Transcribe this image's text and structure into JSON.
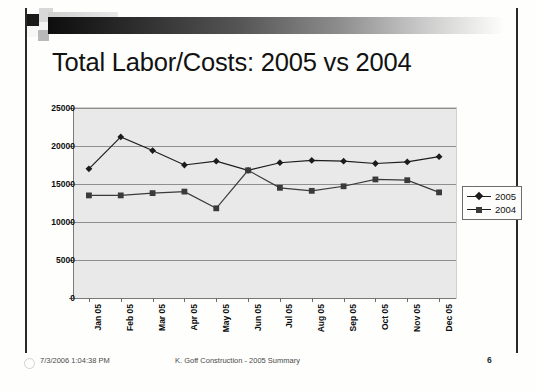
{
  "slide": {
    "title": "Total Labor/Costs: 2005 vs 2004",
    "page_number": "6",
    "footer_date": "7/3/2006 1:04:38 PM",
    "footer_center": "K. Goff Construction - 2005 Summary"
  },
  "colors": {
    "plot_background": "#e9e9e9",
    "gridline": "#8f8f8f",
    "series_2005": "#1c1c1c",
    "series_2004": "#3a3a3a",
    "axis": "#7a7a7a",
    "text": "#111111"
  },
  "chart_data": {
    "type": "line",
    "title": "Total Labor/Costs: 2005 vs 2004",
    "xlabel": "",
    "ylabel": "",
    "categories": [
      "Jan 05",
      "Feb 05",
      "Mar 05",
      "Apr 05",
      "May 05",
      "Jun 05",
      "Jul 05",
      "Aug 05",
      "Sep 05",
      "Oct 05",
      "Nov 05",
      "Dec 05"
    ],
    "ylim": [
      0,
      25000
    ],
    "yticks": [
      0,
      5000,
      10000,
      15000,
      20000,
      25000
    ],
    "ytick_labels": [
      "0",
      "5000",
      "10000",
      "15000",
      "20000",
      "25000"
    ],
    "grid": true,
    "legend_position": "right",
    "series": [
      {
        "name": "2005",
        "marker": "diamond",
        "values": [
          17000,
          21200,
          19400,
          17500,
          18000,
          16800,
          17800,
          18100,
          18000,
          17700,
          17900,
          18600
        ]
      },
      {
        "name": "2004",
        "marker": "square",
        "values": [
          13500,
          13500,
          13800,
          14000,
          11800,
          16800,
          14500,
          14100,
          14700,
          15600,
          15500,
          13900
        ]
      }
    ]
  }
}
